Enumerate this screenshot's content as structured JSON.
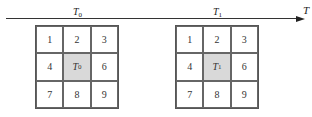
{
  "axis": {
    "label": "T",
    "arrow": "right"
  },
  "frames": [
    {
      "time_label_base": "T",
      "time_label_sub": "0",
      "cells": [
        "1",
        "2",
        "3",
        "4",
        "",
        "6",
        "7",
        "8",
        "9"
      ],
      "center_label_base": "T",
      "center_label_sub": "0"
    },
    {
      "time_label_base": "T",
      "time_label_sub": "1",
      "cells": [
        "1",
        "2",
        "3",
        "4",
        "",
        "6",
        "7",
        "8",
        "9"
      ],
      "center_label_base": "T",
      "center_label_sub": "1"
    }
  ],
  "colors": {
    "center_fill": "#d9d9d9",
    "line": "#333333"
  }
}
